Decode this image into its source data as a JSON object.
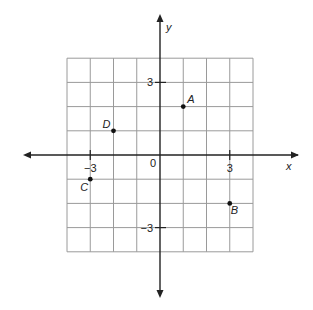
{
  "chart_data": {
    "type": "scatter",
    "title": "",
    "xlabel": "x",
    "ylabel": "y",
    "grid": true,
    "xlim": [
      -4,
      4
    ],
    "ylim": [
      -4,
      4
    ],
    "origin_label": "0",
    "x_tick_labels": [
      {
        "value": -3,
        "label": "−3"
      },
      {
        "value": 3,
        "label": "3"
      }
    ],
    "y_tick_labels": [
      {
        "value": 3,
        "label": "3"
      },
      {
        "value": -3,
        "label": "−3"
      }
    ],
    "points": [
      {
        "name": "A",
        "x": 1,
        "y": 2
      },
      {
        "name": "B",
        "x": 3,
        "y": -2
      },
      {
        "name": "C",
        "x": -3,
        "y": -1
      },
      {
        "name": "D",
        "x": -2,
        "y": 1
      }
    ]
  }
}
